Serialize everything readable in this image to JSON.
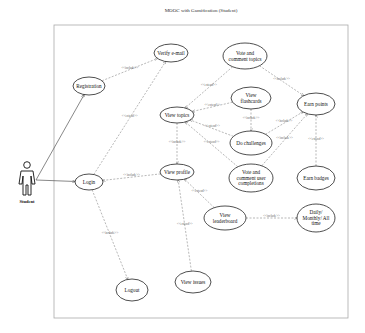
{
  "title": "MOOC with Gamification (Student)",
  "actor": {
    "label": "Student"
  },
  "use_cases": [
    {
      "id": "registration",
      "lines": [
        "Registration"
      ]
    },
    {
      "id": "verify_email",
      "lines": [
        "Verify e-mail"
      ]
    },
    {
      "id": "login",
      "lines": [
        "Login"
      ]
    },
    {
      "id": "logout",
      "lines": [
        "Logout"
      ]
    },
    {
      "id": "view_topics",
      "lines": [
        "View topics"
      ]
    },
    {
      "id": "view_profile",
      "lines": [
        "View profile"
      ]
    },
    {
      "id": "vote_comment_topics",
      "lines": [
        "Vote and",
        "comment topics"
      ]
    },
    {
      "id": "view_flashcards",
      "lines": [
        "View",
        "flashcards"
      ]
    },
    {
      "id": "do_challenges",
      "lines": [
        "Do challenges"
      ]
    },
    {
      "id": "vote_comment_user",
      "lines": [
        "Vote and",
        "comment user",
        "completions"
      ]
    },
    {
      "id": "earn_points",
      "lines": [
        "Earn points"
      ]
    },
    {
      "id": "earn_badges",
      "lines": [
        "Earn badges"
      ]
    },
    {
      "id": "view_leaderboard",
      "lines": [
        "View",
        "leaderboard"
      ]
    },
    {
      "id": "daily_monthly",
      "lines": [
        "Daily/",
        "Monthly/ All",
        "time"
      ]
    },
    {
      "id": "view_issues",
      "lines": [
        "View issues"
      ]
    }
  ],
  "relations": [
    {
      "from": "actor",
      "to": "registration",
      "type": "association",
      "label": ""
    },
    {
      "from": "actor",
      "to": "login",
      "type": "association",
      "label": ""
    },
    {
      "from": "registration",
      "to": "verify_email",
      "type": "include",
      "label": "<<include>>"
    },
    {
      "from": "login",
      "to": "verify_email",
      "type": "extend",
      "label": "<<extend>>"
    },
    {
      "from": "view_profile",
      "to": "login",
      "type": "include",
      "label": "<<include>>"
    },
    {
      "from": "login",
      "to": "logout",
      "type": "include",
      "label": "<<include>>"
    },
    {
      "from": "vote_comment_topics",
      "to": "view_topics",
      "type": "extend",
      "label": "<<extend>>"
    },
    {
      "from": "view_flashcards",
      "to": "view_topics",
      "type": "extend",
      "label": "<<extend>>"
    },
    {
      "from": "do_challenges",
      "to": "view_topics",
      "type": "extend",
      "label": "<<extend>>"
    },
    {
      "from": "vote_comment_user",
      "to": "view_topics",
      "type": "extend",
      "label": "<<extend>>"
    },
    {
      "from": "view_topics",
      "to": "view_profile",
      "type": "include",
      "label": "<<include>>"
    },
    {
      "from": "view_flashcards",
      "to": "do_challenges",
      "type": "include",
      "label": "<<include>>"
    },
    {
      "from": "vote_comment_topics",
      "to": "earn_points",
      "type": "include",
      "label": "<<include>>"
    },
    {
      "from": "do_challenges",
      "to": "earn_points",
      "type": "include",
      "label": "<<include>>"
    },
    {
      "from": "vote_comment_user",
      "to": "earn_points",
      "type": "include",
      "label": "<<include>>"
    },
    {
      "from": "earn_badges",
      "to": "earn_points",
      "type": "extend",
      "label": "<<extend>>"
    },
    {
      "from": "view_leaderboard",
      "to": "view_profile",
      "type": "extend",
      "label": "<<extend>>"
    },
    {
      "from": "view_leaderboard",
      "to": "daily_monthly",
      "type": "include",
      "label": "<<include>>"
    },
    {
      "from": "view_issues",
      "to": "view_profile",
      "type": "extend",
      "label": "<<extend>>"
    }
  ]
}
